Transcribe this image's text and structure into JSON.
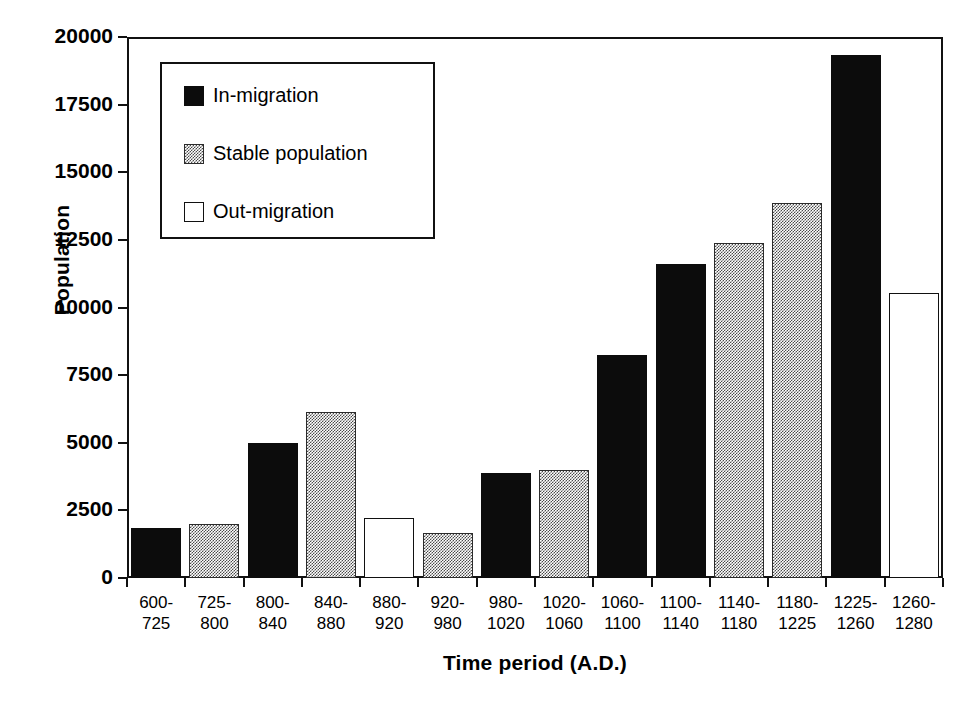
{
  "chart_data": {
    "type": "bar",
    "title": "",
    "xlabel": "Time period (A.D.)",
    "ylabel": "Population",
    "ylim": [
      0,
      20000
    ],
    "yticks": [
      0,
      2500,
      5000,
      7500,
      10000,
      12500,
      15000,
      17500,
      20000
    ],
    "ytick_labels": [
      "0",
      "2500",
      "5000",
      "7500",
      "10000",
      "12500",
      "15000",
      "17500",
      "20000"
    ],
    "grid": false,
    "legend_position": "upper-left-inside",
    "categories": [
      "600-725",
      "725-800",
      "800-840",
      "840-880",
      "880-920",
      "920-980",
      "980-1020",
      "1020-1060",
      "1060-1100",
      "1100-1140",
      "1140-1180",
      "1180-1225",
      "1225-1260",
      "1260-1280"
    ],
    "category_lines": [
      [
        "600-",
        "725"
      ],
      [
        "725-",
        "800"
      ],
      [
        "800-",
        "840"
      ],
      [
        "840-",
        "880"
      ],
      [
        "880-",
        "920"
      ],
      [
        "920-",
        "980"
      ],
      [
        "980-",
        "1020"
      ],
      [
        "1020-",
        "1060"
      ],
      [
        "1060-",
        "1100"
      ],
      [
        "1100-",
        "1140"
      ],
      [
        "1140-",
        "1180"
      ],
      [
        "1180-",
        "1225"
      ],
      [
        "1225-",
        "1260"
      ],
      [
        "1260-",
        "1280"
      ]
    ],
    "values": [
      1850,
      1980,
      5000,
      6150,
      2220,
      1680,
      3870,
      3980,
      8230,
      11600,
      12400,
      13850,
      19350,
      10550
    ],
    "categories_fill": [
      "in-migration",
      "stable",
      "in-migration",
      "stable",
      "out-migration",
      "stable",
      "in-migration",
      "stable",
      "in-migration",
      "in-migration",
      "stable",
      "stable",
      "in-migration",
      "out-migration"
    ]
  },
  "legend": {
    "items": [
      {
        "label": "In-migration",
        "fill": "black"
      },
      {
        "label": "Stable population",
        "fill": "gray"
      },
      {
        "label": "Out-migration",
        "fill": "white"
      }
    ]
  }
}
